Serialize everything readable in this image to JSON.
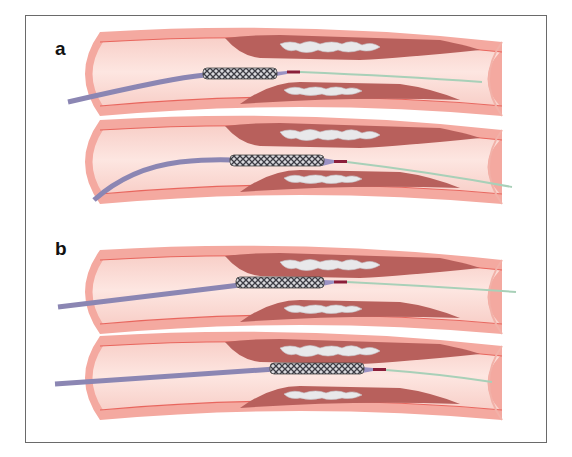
{
  "figure": {
    "panels": [
      {
        "label": "a",
        "description": "Stent delivered over guidewire, curved catheter approach",
        "vessels": 2
      },
      {
        "label": "b",
        "description": "Stent delivered over guidewire, straight catheter approach",
        "vessels": 2
      }
    ],
    "colors": {
      "vessel_wall": "#f4a9a0",
      "vessel_wall_line": "#e8665e",
      "lumen": "#fbd9d3",
      "plaque_dark": "#b8605c",
      "calcium": "#e6e6e6",
      "catheter": "#8b86b3",
      "stent": "#5a5a62",
      "guidewire": "#a8d0b8",
      "tip_marker": "#8a1e3a",
      "frame": "#6a6a6a"
    }
  }
}
